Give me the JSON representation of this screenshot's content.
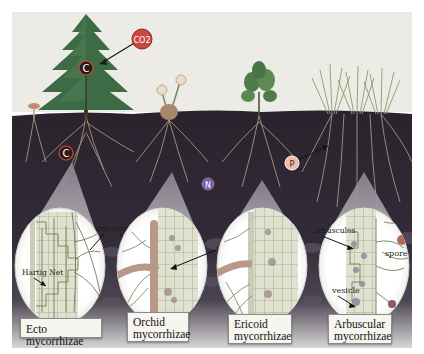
{
  "figure": {
    "markers": {
      "co2": "CO2",
      "carbon_top": "C",
      "carbon_root": "C",
      "nitrogen": "N",
      "phosphorus": "P"
    },
    "panels": [
      {
        "id": "ecto",
        "title_line1": "Ecto mycorrhizae",
        "title_line2": "",
        "annotations": [
          "Hartig Net",
          "mycelium"
        ]
      },
      {
        "id": "orchid",
        "title_line1": "Orchid",
        "title_line2": "mycorrhizae",
        "annotations": [
          "coils"
        ]
      },
      {
        "id": "ericoid",
        "title_line1": "Ericoid",
        "title_line2": "mycorrhizae",
        "annotations": [
          "coils"
        ]
      },
      {
        "id": "arbuscular",
        "title_line1": "Arbuscular",
        "title_line2": "mycorrhizae",
        "annotations": [
          "arbuscules",
          "spore",
          "vesicle"
        ]
      }
    ],
    "colors": {
      "sky": "#ecebe6",
      "soil": "#2c2630",
      "soil_lower": "#4a4450",
      "tree": "#3d6b45",
      "co2_bubble": "#c9473f",
      "root": "#b9a98f",
      "hyphae": "#6f7f5a",
      "cell_fill": "#d9dcc8",
      "lens": "#fbfbf8"
    }
  }
}
